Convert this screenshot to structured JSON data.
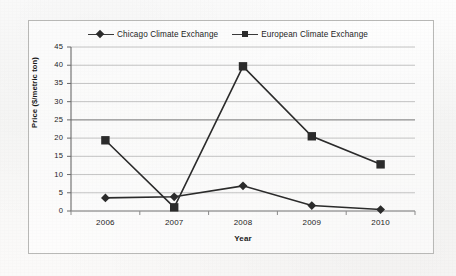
{
  "figure": {
    "background_color": "#f9f8f7",
    "frame_color": "#b9b9b7"
  },
  "legend": {
    "position": "top-center",
    "entries": [
      {
        "label": "Chicago Climate Exchange",
        "marker": "diamond",
        "color": "#2b2b2b"
      },
      {
        "label": "European Climate Exchange",
        "marker": "square",
        "color": "#2b2b2b"
      }
    ]
  },
  "axes": {
    "x_title": "Year",
    "y_title": "Price ($/metric ton)",
    "y_ticks": [
      "0",
      "5",
      "10",
      "15",
      "20",
      "25",
      "30",
      "35",
      "40",
      "45"
    ],
    "x_ticks": [
      "2006",
      "2007",
      "2008",
      "2009",
      "2010"
    ]
  },
  "chart_data": {
    "type": "line",
    "title": "",
    "xlabel": "Year",
    "ylabel": "Price ($/metric ton)",
    "categories": [
      "2006",
      "2007",
      "2008",
      "2009",
      "2010"
    ],
    "ylim": [
      0,
      45
    ],
    "ytick_step": 5,
    "grid": "horizontal",
    "legend_position": "top-center",
    "series": [
      {
        "name": "Chicago Climate Exchange",
        "marker": "diamond",
        "color": "#2b2b2b",
        "values": [
          3.6,
          3.9,
          6.9,
          1.5,
          0.4
        ]
      },
      {
        "name": "European Climate Exchange",
        "marker": "square",
        "color": "#2b2b2b",
        "values": [
          19.4,
          1.0,
          39.7,
          20.5,
          12.8
        ]
      }
    ]
  }
}
